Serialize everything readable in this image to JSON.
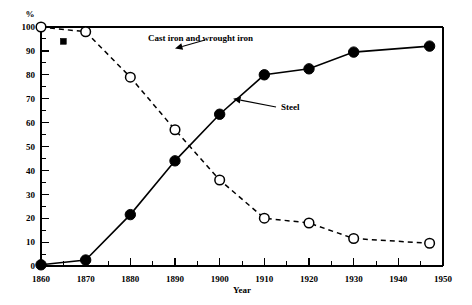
{
  "chart_data": {
    "type": "line",
    "title": "",
    "xlabel": "Year",
    "ylabel": "%",
    "xlim": [
      1860,
      1950
    ],
    "ylim": [
      0,
      100
    ],
    "grid": false,
    "legend_position": "inline-annotations",
    "x_ticks": [
      1860,
      1870,
      1880,
      1890,
      1900,
      1910,
      1920,
      1930,
      1940,
      1950
    ],
    "x_tick_labels": [
      "1860",
      "1870",
      "1880",
      "1890",
      "1900",
      "1910",
      "1920",
      "1930",
      "1940",
      "1950"
    ],
    "x_minor_tick_interval": 5,
    "y_ticks": [
      0,
      10,
      20,
      30,
      40,
      50,
      60,
      70,
      80,
      90,
      100
    ],
    "y_tick_labels": [
      "0",
      "10",
      "20",
      "30",
      "40",
      "50",
      "60",
      "70",
      "80",
      "90",
      "100"
    ],
    "y_minor_tick_interval": 5,
    "series": [
      {
        "name": "Steel",
        "marker": "filled-circle",
        "line_style": "solid",
        "x": [
          1860,
          1870,
          1880,
          1890,
          1900,
          1910,
          1920,
          1930,
          1947
        ],
        "values": [
          0.5,
          2.5,
          21.5,
          44,
          63.5,
          80,
          82.5,
          89.5,
          92
        ]
      },
      {
        "name": "Cast iron and wrought iron",
        "marker": "open-circle",
        "line_style": "dashed",
        "x": [
          1860,
          1870,
          1880,
          1890,
          1900,
          1910,
          1920,
          1930,
          1947
        ],
        "values": [
          100,
          98,
          79,
          57,
          36,
          20,
          18,
          11.5,
          9.5
        ]
      },
      {
        "name": "single-point-marker",
        "marker": "filled-square",
        "line_style": "none",
        "x": [
          1865
        ],
        "values": [
          94
        ]
      }
    ],
    "annotations": [
      {
        "text": "Cast iron and wrought iron",
        "target_x": 1890,
        "target_y": 91
      },
      {
        "text": "Steel",
        "target_x": 1903,
        "target_y": 70
      }
    ]
  }
}
